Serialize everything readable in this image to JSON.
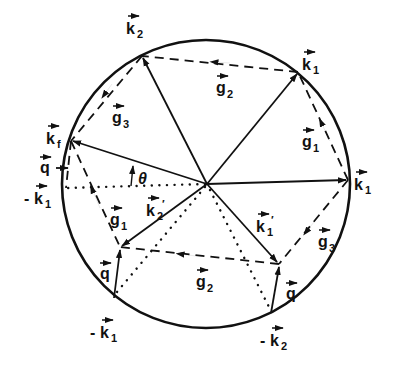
{
  "figure": {
    "type": "vector diagram",
    "circle": {
      "cx": 206,
      "cy": 184,
      "r": 144
    }
  },
  "points": {
    "O": [
      207,
      184
    ],
    "k1_right": [
      348,
      180
    ],
    "k1_top": [
      298,
      72
    ],
    "k2_top": [
      142,
      56
    ],
    "kf": [
      71,
      141
    ],
    "minus_k1_left": [
      66,
      188
    ],
    "A": [
      120,
      247
    ],
    "minus_k1_bottom": [
      114,
      298
    ],
    "B": [
      279,
      264
    ],
    "minus_k2_bottom": [
      271,
      313
    ]
  },
  "labels": {
    "k2_top": {
      "base": "k",
      "sub": "2",
      "prefix": "",
      "x": 126,
      "y": 30
    },
    "k1_top": {
      "base": "k",
      "sub": "1",
      "prefix": "",
      "x": 302,
      "y": 66
    },
    "k1_right": {
      "base": "k",
      "sub": "1",
      "prefix": "",
      "x": 354,
      "y": 186
    },
    "kf": {
      "base": "k",
      "sub": "f",
      "prefix": "",
      "x": 46,
      "y": 140
    },
    "q_left": {
      "base": "q",
      "sub": "",
      "prefix": "",
      "x": 40,
      "y": 170
    },
    "minus_k1_left": {
      "base": "k",
      "sub": "1",
      "prefix": "-",
      "x": 24,
      "y": 200
    },
    "g3_top": {
      "base": "g",
      "sub": "3",
      "prefix": "",
      "x": 112,
      "y": 120
    },
    "g2_top": {
      "base": "g",
      "sub": "2",
      "prefix": "",
      "x": 216,
      "y": 90
    },
    "g1_right": {
      "base": "g",
      "sub": "1",
      "prefix": "",
      "x": 302,
      "y": 144
    },
    "theta": {
      "text": "θ",
      "x": 138,
      "y": 184
    },
    "k2_prime": {
      "base": "k",
      "sub": "2",
      "prefix": "",
      "prime": "′",
      "x": 146,
      "y": 212
    },
    "g1_mid": {
      "base": "g",
      "sub": "1",
      "prefix": "",
      "x": 110,
      "y": 222
    },
    "k1_prime": {
      "base": "k",
      "sub": "1",
      "prefix": "",
      "prime": "′",
      "x": 256,
      "y": 228
    },
    "g3_right": {
      "base": "g",
      "sub": "3",
      "prefix": "",
      "x": 318,
      "y": 244
    },
    "q_bottom_left": {
      "base": "q",
      "sub": "",
      "prefix": "",
      "x": 100,
      "y": 276
    },
    "g2_bottom": {
      "base": "g",
      "sub": "2",
      "prefix": "",
      "x": 196,
      "y": 284
    },
    "q_bottom_right": {
      "base": "q",
      "sub": "",
      "prefix": "",
      "x": 286,
      "y": 296
    },
    "minus_k1_bottom": {
      "base": "k",
      "sub": "1",
      "prefix": "-",
      "x": 90,
      "y": 334
    },
    "minus_k2_bottom": {
      "base": "k",
      "sub": "2",
      "prefix": "-",
      "x": 260,
      "y": 342
    }
  },
  "style": {
    "ink": "#111111",
    "background": "#ffffff"
  }
}
